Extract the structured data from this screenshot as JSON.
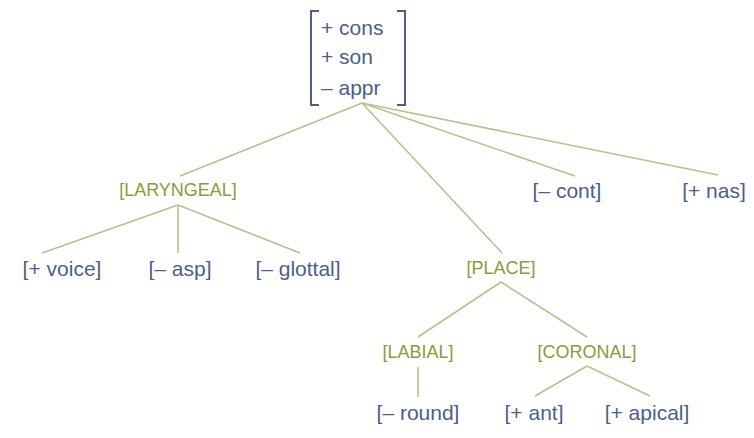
{
  "diagram": {
    "type": "feature-geometry-tree",
    "colors": {
      "feature_text": "#4a5f8c",
      "class_node_text": "#8c9a3c",
      "branch_line": "#b9c08a",
      "background": "#ffffff"
    },
    "root": {
      "features": [
        "+ cons",
        "+ son",
        "– appr"
      ]
    },
    "nodes": {
      "laryngeal": "[LARYNGEAL]",
      "voice": "[+ voice]",
      "asp": "[– asp]",
      "glottal": "[– glottal]",
      "place": "[PLACE]",
      "labial": "[LABIAL]",
      "round": "[– round]",
      "coronal": "[CORONAL]",
      "ant": "[+ ant]",
      "apical": "[+ apical]",
      "cont": "[– cont]",
      "nas": "[+ nas]"
    },
    "edges": [
      [
        "root",
        "laryngeal"
      ],
      [
        "root",
        "place"
      ],
      [
        "root",
        "cont"
      ],
      [
        "root",
        "nas"
      ],
      [
        "laryngeal",
        "voice"
      ],
      [
        "laryngeal",
        "asp"
      ],
      [
        "laryngeal",
        "glottal"
      ],
      [
        "place",
        "labial"
      ],
      [
        "place",
        "coronal"
      ],
      [
        "labial",
        "round"
      ],
      [
        "coronal",
        "ant"
      ],
      [
        "coronal",
        "apical"
      ]
    ]
  }
}
